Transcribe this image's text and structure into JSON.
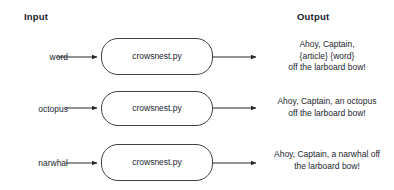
{
  "headers": {
    "input": "Input",
    "output": "Output"
  },
  "process_label": "crowsnest.py",
  "colors": {
    "stroke": "#3c4049",
    "text": "#22262e",
    "header_text": "#20232a",
    "background": "#ffffff"
  },
  "rows": [
    {
      "input": "word",
      "process": "crowsnest.py",
      "output_lines": [
        "Ahoy, Captain,",
        "{article} {word}",
        "off the larboard bow!"
      ]
    },
    {
      "input": "octopus",
      "process": "crowsnest.py",
      "output_lines": [
        "Ahoy, Captain, an octopus",
        "off the larboard bow!"
      ]
    },
    {
      "input": "narwhal",
      "process": "crowsnest.py",
      "output_lines": [
        "Ahoy, Captain, a narwhal off",
        "the larboard bow!"
      ]
    }
  ]
}
